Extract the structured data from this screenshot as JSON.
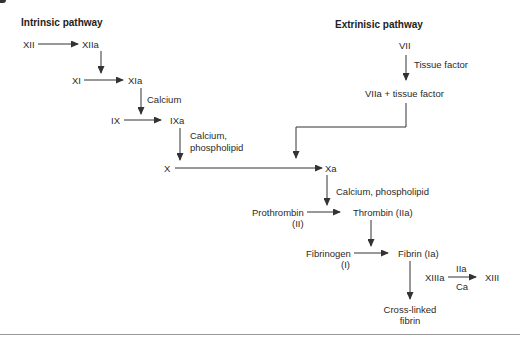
{
  "headings": {
    "intrinsic": "Intrinsic pathway",
    "extrinsic": "Extrinisic pathway"
  },
  "nodes": {
    "xii": "XII",
    "xiia": "XIIa",
    "xi": "XI",
    "xia": "XIa",
    "ix": "IX",
    "ixa": "IXa",
    "x": "X",
    "xa": "Xa",
    "vii": "VII",
    "viia_tf": "VIIa + tissue factor",
    "prothrombin": "Prothrombin",
    "prothrombin_code": "(II)",
    "thrombin": "Thrombin (IIa)",
    "fibrinogen": "Fibrinogen",
    "fibrinogen_code": "(I)",
    "fibrin": "Fibrin (Ia)",
    "xiiia": "XIIIa",
    "xiii": "XIII",
    "crosslinked_1": "Cross-linked",
    "crosslinked_2": "fibrin"
  },
  "cofactors": {
    "calcium": "Calcium",
    "calcium_phospholipid_1": "Calcium,",
    "calcium_phospholipid_2": "phospholipid",
    "tissue_factor": "Tissue factor",
    "xa_cofactor": "Calcium, phospholipid",
    "xiii_top": "IIa",
    "xiii_bottom": "Ca"
  },
  "colors": {
    "line": "#333333",
    "text": "#2a2a2a",
    "rule": "#999999"
  }
}
